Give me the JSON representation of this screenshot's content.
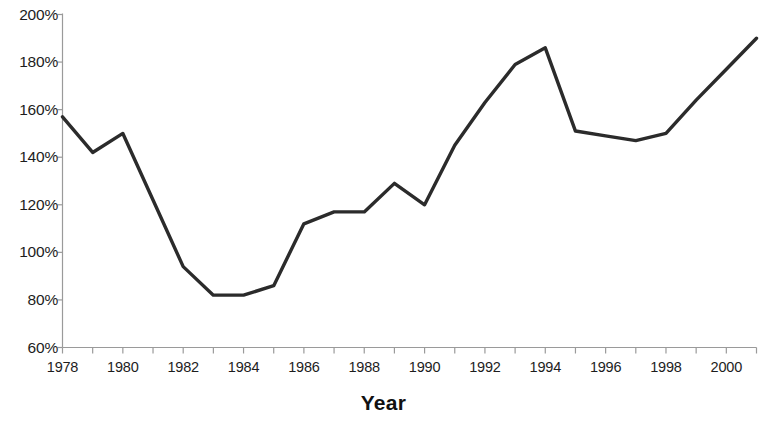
{
  "chart_data": {
    "type": "line",
    "title": "",
    "subtitle": "",
    "xlabel": "Year",
    "ylabel": "",
    "x": [
      1978,
      1979,
      1980,
      1981,
      1982,
      1983,
      1984,
      1985,
      1986,
      1987,
      1988,
      1989,
      1990,
      1991,
      1992,
      1993,
      1994,
      1995,
      1996,
      1997,
      1998,
      1999,
      2000,
      2001
    ],
    "values": [
      157,
      142,
      150,
      122,
      94,
      82,
      82,
      86,
      112,
      117,
      117,
      129,
      120,
      145,
      163,
      179,
      186,
      151,
      149,
      147,
      150,
      164,
      177,
      190
    ],
    "series": [
      {
        "name": "",
        "values": [
          157,
          142,
          150,
          122,
          94,
          82,
          82,
          86,
          112,
          117,
          117,
          129,
          120,
          145,
          163,
          179,
          186,
          151,
          149,
          147,
          150,
          164,
          177,
          190
        ]
      }
    ],
    "xlim": [
      1978,
      2001
    ],
    "ylim": [
      60,
      200
    ],
    "y_tick_values": [
      200,
      180,
      160,
      140,
      120,
      100,
      80,
      60
    ],
    "y_tick_labels": [
      "200%",
      "180%",
      "160%",
      "140%",
      "120%",
      "100%",
      "80%",
      "60%"
    ],
    "x_tick_values": [
      1978,
      1980,
      1982,
      1984,
      1986,
      1988,
      1990,
      1992,
      1994,
      1996,
      1998,
      2000
    ],
    "x_tick_labels": [
      "1978",
      "1980",
      "1982",
      "1984",
      "1986",
      "1988",
      "1990",
      "1992",
      "1994",
      "1996",
      "1998",
      "2000"
    ],
    "x_minor_tick_values": [
      1979,
      1981,
      1983,
      1985,
      1987,
      1989,
      1991,
      1993,
      1995,
      1997,
      1999,
      2001
    ],
    "grid": false,
    "legend": "none",
    "line_color": "#2b2b2b",
    "axis_color": "#9a9a9a",
    "background_color": "#ffffff"
  }
}
